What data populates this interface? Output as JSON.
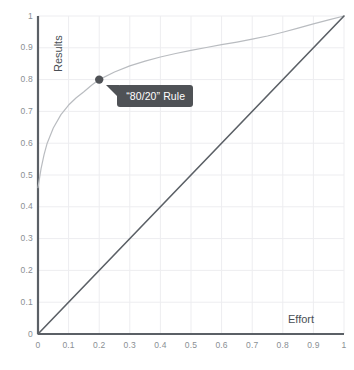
{
  "chart_data": {
    "type": "line",
    "title": "",
    "xlabel": "Effort",
    "ylabel": "Results",
    "xlim": [
      0,
      1
    ],
    "ylim": [
      0,
      1
    ],
    "grid": true,
    "grid_color": "#ededf0",
    "legend": "none",
    "x_ticks": [
      "0",
      "0.1",
      "0.2",
      "0.3",
      "0.4",
      "0.5",
      "0.6",
      "0.7",
      "0.8",
      "0.9",
      "1"
    ],
    "y_ticks": [
      "0",
      "0.1",
      "0.2",
      "0.3",
      "0.4",
      "0.5",
      "0.6",
      "0.7",
      "0.8",
      "0.9",
      "1"
    ],
    "x_tick_values": [
      0,
      0.1,
      0.2,
      0.3,
      0.4,
      0.5,
      0.6,
      0.7,
      0.8,
      0.9,
      1
    ],
    "y_tick_values": [
      0,
      0.1,
      0.2,
      0.3,
      0.4,
      0.5,
      0.6,
      0.7,
      0.8,
      0.9,
      1
    ],
    "series": [
      {
        "name": "Pareto curve",
        "type": "line",
        "color": "#b9bcc0",
        "x": [
          0,
          0.01,
          0.02,
          0.03,
          0.05,
          0.075,
          0.1,
          0.125,
          0.15,
          0.175,
          0.2,
          0.25,
          0.3,
          0.35,
          0.4,
          0.45,
          0.5,
          0.55,
          0.6,
          0.65,
          0.7,
          0.75,
          0.8,
          0.85,
          0.9,
          0.95,
          1
        ],
        "y": [
          0.46,
          0.52,
          0.565,
          0.6,
          0.648,
          0.69,
          0.72,
          0.743,
          0.762,
          0.782,
          0.8,
          0.824,
          0.843,
          0.858,
          0.871,
          0.882,
          0.892,
          0.901,
          0.91,
          0.918,
          0.927,
          0.937,
          0.949,
          0.962,
          0.975,
          0.988,
          1
        ]
      },
      {
        "name": "Linear reference",
        "type": "line",
        "color": "#5b6066",
        "x": [
          0,
          1
        ],
        "y": [
          0,
          1
        ]
      }
    ],
    "points": [
      {
        "name": "pareto-point",
        "x": 0.2,
        "y": 0.8,
        "color": "#4f5256",
        "radius": 4.2
      }
    ],
    "annotations": [
      {
        "name": "pareto-callout",
        "text": "“80/20” Rule",
        "background": "#4f5256",
        "text_color": "#ffffff",
        "anchor_x": 0.2,
        "anchor_y": 0.8
      }
    ],
    "axis_color": "#5b6066",
    "tick_label_color": "#8a8f94",
    "axis_title_color": "#4a4f55",
    "background": "#ffffff"
  }
}
